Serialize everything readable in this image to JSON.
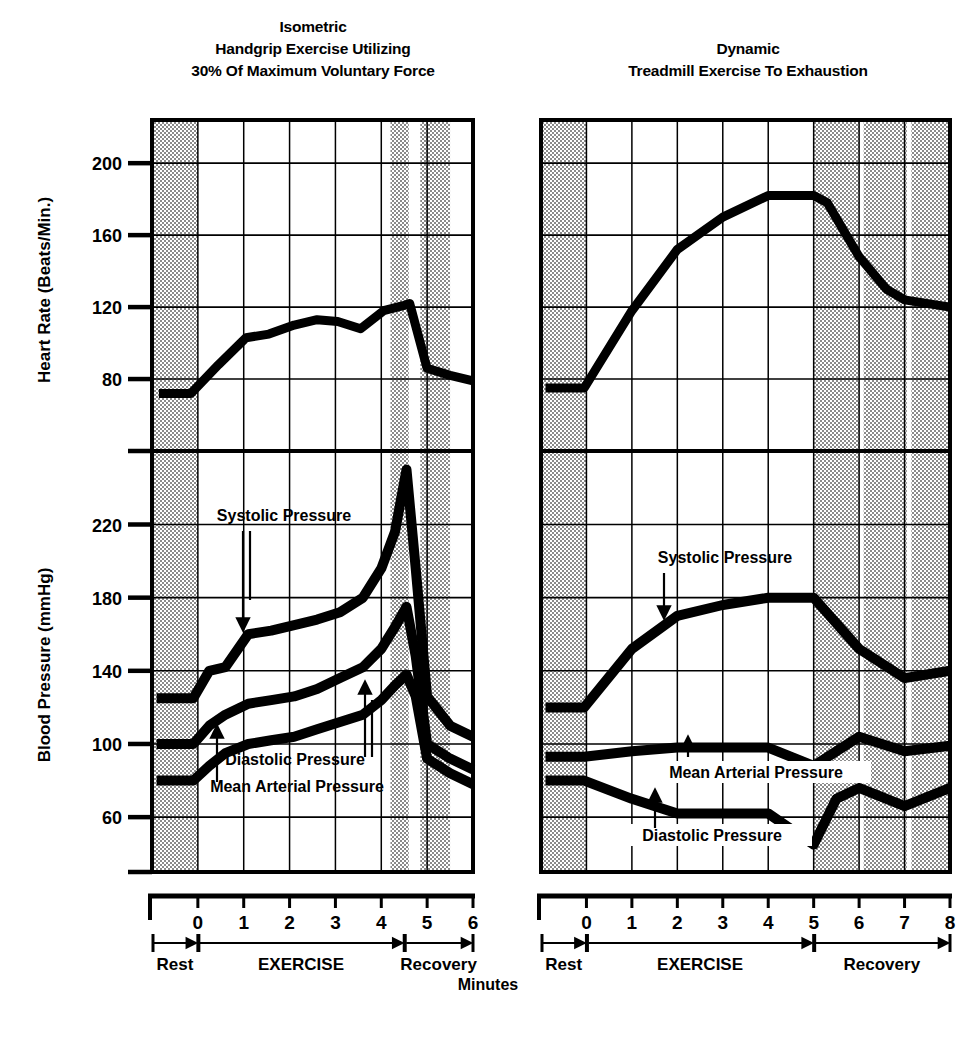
{
  "figure": {
    "x_axis_name": "Minutes",
    "panels": [
      {
        "id": "isometric",
        "title_lines": [
          "Isometric",
          "Handgrip Exercise Utilizing",
          "30% Of Maximum Voluntary Force"
        ],
        "phases": [
          {
            "label": "Rest",
            "start": -1,
            "end": 0
          },
          {
            "label": "EXERCISE",
            "start": 0,
            "end": 4.5
          },
          {
            "label": "Recovery",
            "start": 4.5,
            "end": 6
          }
        ],
        "x_ticks": [
          "0",
          "1",
          "2",
          "3",
          "4",
          "5",
          "6"
        ],
        "shaded_bands": [
          [
            -1,
            0
          ],
          [
            4.2,
            4.6
          ],
          [
            4.85,
            5.5
          ]
        ]
      },
      {
        "id": "dynamic",
        "title_lines": [
          "Dynamic",
          "Treadmill Exercise To Exhaustion"
        ],
        "phases": [
          {
            "label": "Rest",
            "start": -1,
            "end": 0
          },
          {
            "label": "EXERCISE",
            "start": 0,
            "end": 5
          },
          {
            "label": "Recovery",
            "start": 5,
            "end": 8
          }
        ],
        "x_ticks": [
          "0",
          "1",
          "2",
          "3",
          "4",
          "5",
          "6",
          "7",
          "8"
        ],
        "shaded_bands": [
          [
            -1,
            0
          ],
          [
            5,
            6
          ],
          [
            6.1,
            7.05
          ],
          [
            7.15,
            8
          ]
        ]
      }
    ]
  },
  "chart_data": [
    {
      "type": "line",
      "id": "heart-rate-isometric",
      "title": "Isometric Handgrip Exercise Utilizing 30% Of Maximum Voluntary Force",
      "ylabel": "Heart Rate (Beats/Min.)",
      "xlabel": "Minutes",
      "ylim": [
        40,
        224
      ],
      "xlim": [
        -1,
        6
      ],
      "y_ticks": [
        200,
        160,
        120,
        80
      ],
      "x_ticks": [
        0,
        1,
        2,
        3,
        4,
        5,
        6
      ],
      "grid": true,
      "series": [
        {
          "name": "Heart Rate",
          "x": [
            -0.85,
            -0.15,
            0.45,
            1.05,
            1.55,
            2.1,
            2.6,
            3.05,
            3.55,
            4.05,
            4.5,
            4.62,
            5.0,
            5.5,
            6.0
          ],
          "values": [
            72,
            72,
            88,
            103,
            105,
            110,
            113,
            112,
            108,
            118,
            121,
            122,
            86,
            82,
            79
          ]
        }
      ]
    },
    {
      "type": "line",
      "id": "blood-pressure-isometric",
      "title": "Isometric Handgrip Exercise Utilizing 30% Of Maximum Voluntary Force",
      "ylabel": "Blood Pressure (mmHg)",
      "xlabel": "Minutes",
      "ylim": [
        30,
        258
      ],
      "xlim": [
        -1,
        6
      ],
      "y_ticks": [
        220,
        180,
        140,
        100,
        60
      ],
      "x_ticks": [
        0,
        1,
        2,
        3,
        4,
        5,
        6
      ],
      "grid": true,
      "annotations": [
        {
          "text": "Systolic Pressure",
          "target_series": "Systolic Pressure"
        },
        {
          "text": "Diastolic Pressure",
          "target_series": "Diastolic Pressure"
        },
        {
          "text": "Mean Arterial Pressure",
          "target_series": "Mean Arterial Pressure"
        }
      ],
      "series": [
        {
          "name": "Systolic Pressure",
          "x": [
            -0.9,
            -0.1,
            0.25,
            0.6,
            1.1,
            1.6,
            2.1,
            2.6,
            3.1,
            3.6,
            4.0,
            4.3,
            4.55,
            4.75,
            5.0,
            5.5,
            6.0
          ],
          "values": [
            125,
            125,
            140,
            142,
            160,
            162,
            165,
            168,
            172,
            180,
            196,
            216,
            250,
            196,
            126,
            110,
            104
          ]
        },
        {
          "name": "Mean Arterial Pressure",
          "x": [
            -0.9,
            -0.1,
            0.25,
            0.6,
            1.1,
            1.6,
            2.1,
            2.6,
            3.1,
            3.6,
            4.0,
            4.3,
            4.55,
            4.75,
            5.0,
            5.5,
            6.0
          ],
          "values": [
            100,
            100,
            110,
            116,
            122,
            124,
            126,
            130,
            136,
            142,
            152,
            164,
            175,
            148,
            100,
            92,
            86
          ]
        },
        {
          "name": "Diastolic Pressure",
          "x": [
            -0.9,
            -0.1,
            0.25,
            0.6,
            1.1,
            1.6,
            2.1,
            2.6,
            3.1,
            3.6,
            4.0,
            4.3,
            4.55,
            4.75,
            5.0,
            5.5,
            6.0
          ],
          "values": [
            80,
            80,
            88,
            95,
            100,
            102,
            104,
            108,
            112,
            116,
            124,
            132,
            138,
            126,
            92,
            84,
            78
          ]
        }
      ]
    },
    {
      "type": "line",
      "id": "heart-rate-dynamic",
      "title": "Dynamic Treadmill Exercise To Exhaustion",
      "ylabel": "Heart Rate (Beats/Min.)",
      "xlabel": "Minutes",
      "ylim": [
        40,
        224
      ],
      "xlim": [
        -1,
        8
      ],
      "y_ticks": [
        200,
        160,
        120,
        80
      ],
      "x_ticks": [
        0,
        1,
        2,
        3,
        4,
        5,
        6,
        7,
        8
      ],
      "grid": true,
      "series": [
        {
          "name": "Heart Rate",
          "x": [
            -0.9,
            -0.05,
            1.0,
            2.0,
            3.0,
            4.0,
            5.0,
            5.3,
            6.0,
            6.6,
            7.0,
            8.0
          ],
          "values": [
            75,
            75,
            118,
            152,
            170,
            182,
            182,
            178,
            148,
            130,
            124,
            120
          ]
        }
      ]
    },
    {
      "type": "line",
      "id": "blood-pressure-dynamic",
      "title": "Dynamic Treadmill Exercise To Exhaustion",
      "ylabel": "Blood Pressure (mmHg)",
      "xlabel": "Minutes",
      "ylim": [
        30,
        258
      ],
      "xlim": [
        -1,
        8
      ],
      "y_ticks": [
        220,
        180,
        140,
        100,
        60
      ],
      "x_ticks": [
        0,
        1,
        2,
        3,
        4,
        5,
        6,
        7,
        8
      ],
      "grid": true,
      "annotations": [
        {
          "text": "Systolic Pressure",
          "target_series": "Systolic Pressure"
        },
        {
          "text": "Mean Arterial Pressure",
          "target_series": "Mean Arterial Pressure"
        },
        {
          "text": "Diastolic Pressure",
          "target_series": "Diastolic Pressure"
        }
      ],
      "series": [
        {
          "name": "Systolic Pressure",
          "x": [
            -0.9,
            -0.05,
            1.0,
            2.0,
            3.0,
            4.0,
            5.0,
            6.0,
            7.0,
            8.0
          ],
          "values": [
            120,
            120,
            152,
            170,
            176,
            180,
            180,
            152,
            136,
            140
          ]
        },
        {
          "name": "Mean Arterial Pressure",
          "x": [
            -0.9,
            -0.05,
            1.0,
            2.0,
            3.0,
            4.0,
            5.0,
            5.5,
            6.0,
            7.0,
            8.0
          ],
          "values": [
            93,
            93,
            96,
            98,
            98,
            98,
            88,
            96,
            104,
            96,
            99
          ]
        },
        {
          "name": "Diastolic Pressure",
          "x": [
            -0.9,
            -0.05,
            1.0,
            2.0,
            3.0,
            4.0,
            5.0,
            5.5,
            6.0,
            7.0,
            8.0
          ],
          "values": [
            80,
            80,
            70,
            62,
            62,
            62,
            45,
            70,
            76,
            66,
            76
          ]
        }
      ]
    }
  ]
}
